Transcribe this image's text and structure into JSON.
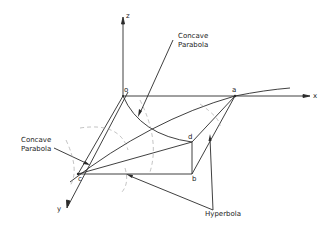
{
  "figure": {
    "axes": {
      "x": "x",
      "y": "y",
      "z": "z"
    },
    "points": {
      "o": "o",
      "a": "a",
      "b": "b",
      "c": "c",
      "d": "d"
    },
    "labels": {
      "concave_parabola_top_1": "Concave",
      "concave_parabola_top_2": "Parabola",
      "concave_parabola_left_1": "Concave",
      "concave_parabola_left_2": "Parabola",
      "hyperbola": "Hyperbola"
    },
    "colors": {
      "line": "#2a2a2a",
      "dashed": "#9a9a9a",
      "background": "#ffffff"
    }
  }
}
